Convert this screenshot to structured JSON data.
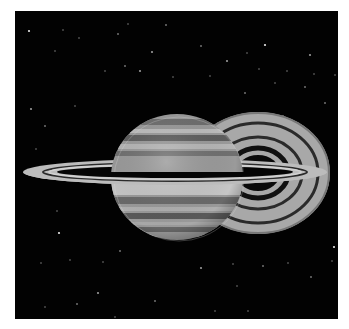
{
  "image": {
    "subject": "Saturn with rings against a starfield",
    "background_color": "#020202",
    "border_color": "#ffffff",
    "frame": {
      "x": 15,
      "y": 11,
      "width": 323,
      "height": 308
    }
  },
  "planet": {
    "cx": 162,
    "cy": 166,
    "rx": 66,
    "ry": 63,
    "base_color": "#9a9a9a",
    "bands": [
      {
        "y": 108,
        "h": 6,
        "color": "#6e6e6e"
      },
      {
        "y": 118,
        "h": 4,
        "color": "#bdbdbd"
      },
      {
        "y": 124,
        "h": 6,
        "color": "#5e5e5e"
      },
      {
        "y": 133,
        "h": 5,
        "color": "#b6b6b6"
      },
      {
        "y": 140,
        "h": 5,
        "color": "#707070"
      },
      {
        "y": 170,
        "h": 14,
        "color": "#c6c6c6"
      },
      {
        "y": 186,
        "h": 7,
        "color": "#6a6a6a"
      },
      {
        "y": 196,
        "h": 4,
        "color": "#b0b0b0"
      },
      {
        "y": 202,
        "h": 6,
        "color": "#595959"
      },
      {
        "y": 211,
        "h": 3,
        "color": "#a8a8a8"
      },
      {
        "y": 216,
        "h": 5,
        "color": "#676767"
      },
      {
        "y": 223,
        "h": 3,
        "color": "#9a9a9a"
      }
    ]
  },
  "rear_ring_disk": {
    "cx": 243,
    "cy": 162,
    "rx": 72,
    "ry": 61,
    "color": "#a8a8a8",
    "gaps": [
      {
        "rx": 60,
        "ry": 50
      },
      {
        "rx": 44,
        "ry": 36
      },
      {
        "rx": 30,
        "ry": 25
      }
    ]
  },
  "front_ring": {
    "cx": 160,
    "cy": 161,
    "rx": 152,
    "ry": 13,
    "color": "#bcbcbc",
    "gap": {
      "rx": 132,
      "ry": 9
    },
    "inner": {
      "rx": 118,
      "ry": 6
    }
  },
  "stars": [
    [
      14,
      20
    ],
    [
      48,
      19
    ],
    [
      64,
      27
    ],
    [
      103,
      23
    ],
    [
      113,
      13
    ],
    [
      137,
      41
    ],
    [
      151,
      14
    ],
    [
      40,
      40
    ],
    [
      90,
      60
    ],
    [
      110,
      55
    ],
    [
      125,
      60
    ],
    [
      158,
      66
    ],
    [
      186,
      35
    ],
    [
      195,
      65
    ],
    [
      232,
      42
    ],
    [
      250,
      34
    ],
    [
      244,
      58
    ],
    [
      272,
      60
    ],
    [
      290,
      76
    ],
    [
      299,
      63
    ],
    [
      212,
      50
    ],
    [
      230,
      82
    ],
    [
      260,
      72
    ],
    [
      320,
      64
    ],
    [
      310,
      92
    ],
    [
      16,
      98
    ],
    [
      60,
      95
    ],
    [
      30,
      115
    ],
    [
      21,
      138
    ],
    [
      42,
      200
    ],
    [
      44,
      222
    ],
    [
      55,
      249
    ],
    [
      88,
      251
    ],
    [
      105,
      240
    ],
    [
      26,
      252
    ],
    [
      83,
      282
    ],
    [
      62,
      293
    ],
    [
      100,
      306
    ],
    [
      30,
      296
    ],
    [
      140,
      290
    ],
    [
      186,
      257
    ],
    [
      218,
      253
    ],
    [
      248,
      255
    ],
    [
      273,
      252
    ],
    [
      317,
      250
    ],
    [
      319,
      236
    ],
    [
      222,
      275
    ],
    [
      233,
      300
    ],
    [
      296,
      266
    ],
    [
      328,
      218
    ],
    [
      295,
      44
    ],
    [
      268,
      105
    ],
    [
      330,
      140
    ],
    [
      200,
      300
    ]
  ]
}
